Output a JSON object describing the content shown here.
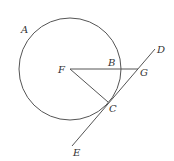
{
  "diagram": {
    "type": "geometry",
    "colors": {
      "line": "#555555",
      "label": "#333333",
      "background": "#ffffff"
    },
    "circle": {
      "center": "F",
      "cx": 70,
      "cy": 69,
      "r": 51
    },
    "points": {
      "A": {
        "label": "A",
        "x": 26,
        "y": 33
      },
      "B": {
        "label": "B",
        "x": 120,
        "y": 69
      },
      "C": {
        "label": "C",
        "x": 108,
        "y": 102
      },
      "D": {
        "label": "D",
        "x": 155,
        "y": 49
      },
      "E": {
        "label": "E",
        "x": 72,
        "y": 146
      },
      "F": {
        "label": "F",
        "x": 70,
        "y": 69
      },
      "G": {
        "label": "G",
        "x": 138,
        "y": 69
      }
    },
    "segments": [
      {
        "name": "FG",
        "from": "F",
        "to": "G"
      },
      {
        "name": "FC",
        "from": "F",
        "to": "C"
      },
      {
        "name": "ED",
        "from": "E",
        "to": "D"
      }
    ]
  }
}
